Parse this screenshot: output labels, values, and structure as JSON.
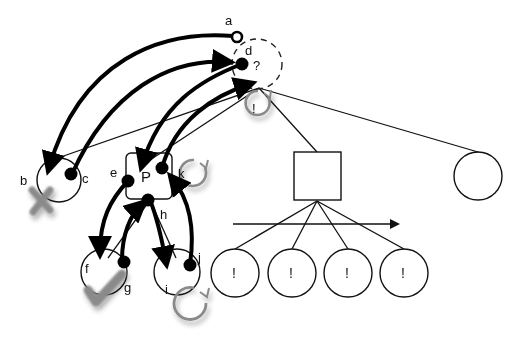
{
  "diagram": {
    "type": "behavior-tree-reactive-plan",
    "nodes": {
      "a": {
        "label": "a",
        "kind": "open-port"
      },
      "b": {
        "label": "b",
        "kind": "leaf-failed",
        "status_icon": "x-mark"
      },
      "c": {
        "label": "c",
        "kind": "port"
      },
      "d": {
        "label": "d",
        "kind": "port",
        "annotation": "?"
      },
      "e": {
        "label": "e",
        "kind": "port"
      },
      "f": {
        "label": "f",
        "kind": "leaf-succeeded",
        "status_icon": "check-mark"
      },
      "g": {
        "label": "g",
        "kind": "port"
      },
      "h": {
        "label": "h",
        "kind": "port"
      },
      "i": {
        "label": "i",
        "kind": "leaf-running",
        "status_icon": "loop-arrow"
      },
      "j": {
        "label": "j",
        "kind": "port"
      },
      "k": {
        "label": "k",
        "kind": "running",
        "status_icon": "loop-arrow"
      },
      "P": {
        "label": "P",
        "kind": "parallel-node"
      },
      "root": {
        "label": "!",
        "kind": "root-running",
        "status_icon": "loop-arrow"
      },
      "sequence": {
        "kind": "sequence-box",
        "arrow": "left-to-right"
      },
      "right_leaf": {
        "kind": "leaf-circle"
      },
      "seq_children": [
        {
          "label": "!"
        },
        {
          "label": "!"
        },
        {
          "label": "!"
        },
        {
          "label": "!"
        }
      ]
    },
    "labels": {
      "a": "a",
      "b": "b",
      "c": "c",
      "d": "d",
      "question": "?",
      "e": "e",
      "f": "f",
      "g": "g",
      "h": "h",
      "i": "i",
      "j": "j",
      "k": "k",
      "P": "P",
      "root_mark": "!",
      "bang1": "!",
      "bang2": "!",
      "bang3": "!",
      "bang4": "!"
    },
    "colors": {
      "stroke": "#111111",
      "thick_arrow": "#000000",
      "status_gray": "#888888",
      "background": "#ffffff"
    }
  }
}
